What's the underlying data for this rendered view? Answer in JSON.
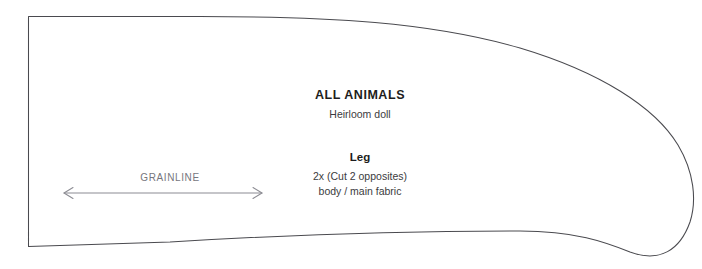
{
  "sheet": {
    "background_color": "#ffffff",
    "outline_color": "#4a4a4f",
    "grainline_color": "#8c8c93"
  },
  "title_block": {
    "brand": "ALL ANIMALS",
    "collection": "Heirloom doll"
  },
  "piece_block": {
    "name": "Leg",
    "cut_count": "2x (Cut 2 opposites)",
    "fabric": "body / main fabric"
  },
  "grainline": {
    "label": "GRAINLINE",
    "arrow_left_x": 64,
    "arrow_right_x": 262,
    "arrow_y": 193
  },
  "outline": {
    "shape": "leg-pattern-piece",
    "path": "M 28.5,16.5 L 28.5,246.5 L 170,242 C 300,234 420,231 520,231 C 575,231 605,242 630,252 C 660,263 680,250 690,222 C 697,200 694,172 678,145 C 655,107 600,72 520,48 C 430,22 330,16.5 200,16.5 Z"
  }
}
